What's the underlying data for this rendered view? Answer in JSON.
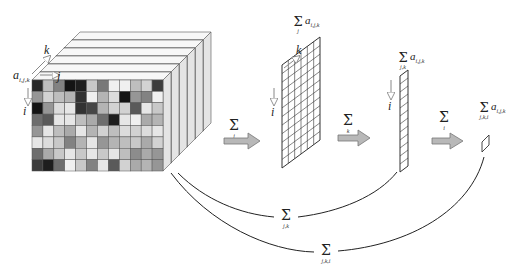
{
  "diagram": {
    "colors": {
      "frame_fill": "#f2f2f2",
      "frame_stroke": "#555555",
      "grid_stroke": "#333333",
      "arrow_fill": "#b8b8b8",
      "arrow_stroke": "#777777",
      "curve_stroke": "#222222"
    },
    "cube": {
      "element_label": "a",
      "element_subscript": "i,j,k",
      "axis_k": "k",
      "axis_j": "j",
      "axis_i": "i",
      "frames": 6,
      "grid_rows": 8,
      "grid_cols": 12,
      "cell_gray": [
        [
          40,
          190,
          130,
          20,
          30,
          200,
          120,
          240,
          240,
          190,
          210,
          60
        ],
        [
          150,
          210,
          190,
          180,
          50,
          240,
          180,
          220,
          20,
          150,
          130,
          240
        ],
        [
          20,
          150,
          220,
          230,
          50,
          70,
          180,
          210,
          210,
          90,
          230,
          200
        ],
        [
          110,
          90,
          230,
          230,
          190,
          170,
          110,
          30,
          230,
          240,
          170,
          180
        ],
        [
          150,
          230,
          190,
          170,
          230,
          180,
          210,
          190,
          220,
          210,
          220,
          230
        ],
        [
          230,
          220,
          200,
          130,
          180,
          230,
          150,
          180,
          190,
          200,
          170,
          210
        ],
        [
          110,
          170,
          200,
          230,
          200,
          230,
          200,
          230,
          190,
          140,
          170,
          150
        ],
        [
          60,
          30,
          110,
          240,
          200,
          130,
          230,
          90,
          210,
          170,
          180,
          150
        ]
      ]
    },
    "steps": [
      {
        "id": "sum-j",
        "arrow_label": "Σ",
        "arrow_sub": "j",
        "result_label": "Σ a",
        "result_sum_sub": "j",
        "result_elem_sub": "i,j,k",
        "axis_k": "k",
        "axis_i": "i",
        "rows": 12,
        "cols": 6
      },
      {
        "id": "sum-k",
        "arrow_label": "Σ",
        "arrow_sub": "k",
        "result_label": "Σ a",
        "result_sum_sub": "j,k",
        "result_elem_sub": "i,j,k",
        "axis_i": "i",
        "rows": 12,
        "cols": 1
      },
      {
        "id": "sum-i",
        "arrow_label": "Σ",
        "arrow_sub": "i",
        "result_label": "Σ a",
        "result_sum_sub": "j,k,i",
        "result_elem_sub": "i,j,k",
        "rows": 1,
        "cols": 1
      }
    ],
    "shortcuts": [
      {
        "id": "sum-jk",
        "label": "Σ",
        "sub": "j,k"
      },
      {
        "id": "sum-jki",
        "label": "Σ",
        "sub": "j,k,i"
      }
    ]
  }
}
